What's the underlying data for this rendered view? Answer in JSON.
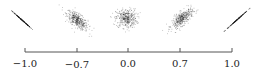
{
  "chart_data": {
    "type": "scatter",
    "title": "",
    "xlabel": "",
    "ylabel": "",
    "axis": {
      "ticks": [
        -1.0,
        -0.7,
        0.0,
        0.7,
        1.0
      ],
      "tick_labels": [
        "−1.0",
        "−0.7",
        "0.0",
        "0.7",
        "1.0"
      ],
      "grid": false
    },
    "series": [
      {
        "name": "r = -1.0",
        "correlation": -1.0,
        "shape": "perfect line, negative slope"
      },
      {
        "name": "r = -0.7",
        "correlation": -0.7,
        "shape": "elongated cloud, negative slope"
      },
      {
        "name": "r = 0.0",
        "correlation": 0.0,
        "shape": "round cloud, no slope"
      },
      {
        "name": "r = 0.7",
        "correlation": 0.7,
        "shape": "elongated cloud, positive slope"
      },
      {
        "name": "r = 1.0",
        "correlation": 1.0,
        "shape": "perfect line, positive slope"
      }
    ],
    "colors": {
      "points": "#1a1a1a",
      "axis": "#444444",
      "text": "#222222"
    }
  }
}
